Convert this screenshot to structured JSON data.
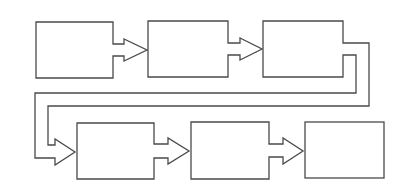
{
  "diagram": {
    "type": "flow-block-diagram",
    "background": "#ffffff",
    "stroke_color": "#4a4a4a",
    "blocks": [
      {
        "id": "block-1",
        "label": "",
        "x": 36,
        "y": 22,
        "w": 77,
        "h": 56
      },
      {
        "id": "block-2",
        "label": "",
        "x": 148,
        "y": 21,
        "w": 80,
        "h": 56
      },
      {
        "id": "block-3",
        "label": "",
        "x": 263,
        "y": 21,
        "w": 80,
        "h": 56
      },
      {
        "id": "block-4",
        "label": "",
        "x": 77,
        "y": 123,
        "w": 77,
        "h": 56
      },
      {
        "id": "block-5",
        "label": "",
        "x": 191,
        "y": 122,
        "w": 78,
        "h": 57
      },
      {
        "id": "block-6",
        "label": "",
        "x": 305,
        "y": 122,
        "w": 79,
        "h": 56
      }
    ],
    "connectors": [
      {
        "from": "block-1",
        "to": "block-2",
        "style": "block-arrow"
      },
      {
        "from": "block-2",
        "to": "block-3",
        "style": "block-arrow"
      },
      {
        "from": "block-3",
        "to": "block-4",
        "style": "wrap-around-block-arrow"
      },
      {
        "from": "block-4",
        "to": "block-5",
        "style": "block-arrow"
      },
      {
        "from": "block-5",
        "to": "block-6",
        "style": "block-arrow"
      }
    ]
  }
}
